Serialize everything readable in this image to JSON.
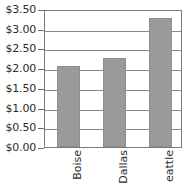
{
  "chart_data": {
    "type": "bar",
    "title": "",
    "xlabel": "",
    "ylabel": "",
    "categories": [
      "Boise",
      "Dallas",
      "eattle"
    ],
    "values": [
      2.06,
      2.26,
      3.27
    ],
    "ylim": [
      0,
      3.5
    ],
    "y_tick_labels": [
      "$3.50",
      "$3.00",
      "$2.50",
      "$2.00",
      "$1.50",
      "$1.00",
      "$0.50",
      "$0.00"
    ],
    "y_tick_values": [
      3.5,
      3.0,
      2.5,
      2.0,
      1.5,
      1.0,
      0.5,
      0.0
    ],
    "grid": true,
    "legend": "none",
    "bar_color": "#9a9a9a",
    "axis_color": "#7a7a7a",
    "text_color": "#2b2b2b"
  }
}
